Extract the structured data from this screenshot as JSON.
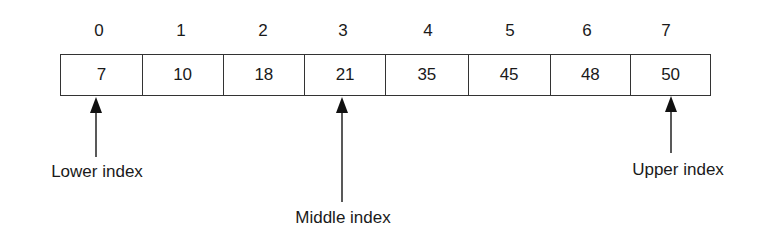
{
  "diagram": {
    "type": "binary-search-array",
    "indices": [
      "0",
      "1",
      "2",
      "3",
      "4",
      "5",
      "6",
      "7"
    ],
    "values": [
      "7",
      "10",
      "18",
      "21",
      "35",
      "45",
      "48",
      "50"
    ],
    "pointers": {
      "lower": {
        "label": "Lower index",
        "index": 0
      },
      "middle": {
        "label": "Middle index",
        "index": 3
      },
      "upper": {
        "label": "Upper index",
        "index": 7
      }
    }
  }
}
